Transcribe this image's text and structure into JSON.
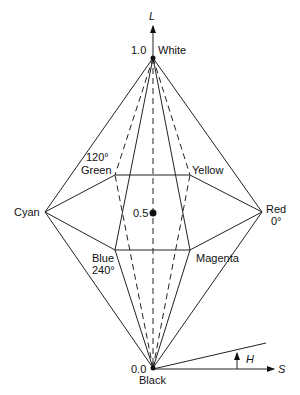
{
  "diagram": {
    "axes": {
      "L": "L",
      "S": "S",
      "H": "H"
    },
    "levels": {
      "top_value": "1.0",
      "top_label": "White",
      "mid_value": "0.5",
      "bottom_value": "0.0",
      "bottom_label": "Black"
    },
    "vertices": {
      "green": {
        "label": "Green",
        "angle": "120°"
      },
      "yellow": {
        "label": "Yellow"
      },
      "cyan": {
        "label": "Cyan"
      },
      "red": {
        "label": "Red",
        "angle": "0°"
      },
      "blue": {
        "label": "Blue",
        "angle": "240°"
      },
      "magenta": {
        "label": "Magenta"
      }
    }
  }
}
